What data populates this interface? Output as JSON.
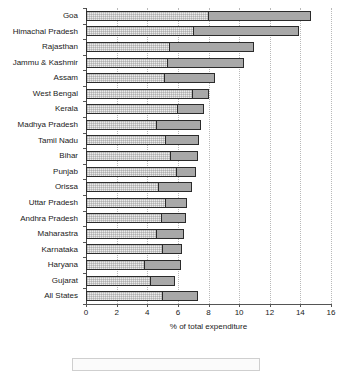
{
  "chart_data": {
    "type": "bar",
    "orientation": "horizontal",
    "stacked": true,
    "title": "",
    "xlabel": "% of total expenditure",
    "ylabel": "",
    "xlim": [
      0,
      16
    ],
    "xticks": [
      0,
      2,
      4,
      6,
      8,
      10,
      12,
      14,
      16
    ],
    "xtick_labels": [
      "0",
      "2",
      "4",
      "6",
      "8",
      "10",
      "12",
      "14",
      "16"
    ],
    "grid": "vertical-dotted",
    "legend": "none",
    "categories": [
      "Goa",
      "Himachal Pradesh",
      "Rajasthan",
      "Jammu & Kashmir",
      "Assam",
      "West Bengal",
      "Kerala",
      "Madhya Pradesh",
      "Tamil Nadu",
      "Bihar",
      "Punjab",
      "Orissa",
      "Uttar Pradesh",
      "Andhra Pradesh",
      "Maharastra",
      "Karnataka",
      "Haryana",
      "Gujarat",
      "All States"
    ],
    "series": [
      {
        "name": "segment-a",
        "color": "#ebebeb",
        "values": [
          8.0,
          7.0,
          5.4,
          5.3,
          5.1,
          7.0,
          6.0,
          4.6,
          5.2,
          5.5,
          5.9,
          4.7,
          5.2,
          4.9,
          4.6,
          5.0,
          3.8,
          4.2,
          5.0
        ]
      },
      {
        "name": "segment-b",
        "color": "#a8a8a8",
        "values": [
          6.7,
          6.9,
          5.6,
          5.0,
          3.3,
          1.0,
          1.7,
          2.9,
          2.2,
          1.8,
          1.3,
          2.2,
          1.4,
          1.6,
          1.8,
          1.3,
          2.4,
          1.6,
          2.3
        ]
      }
    ],
    "totals": [
      14.7,
      13.9,
      11.0,
      10.3,
      8.4,
      8.0,
      7.7,
      7.5,
      7.4,
      7.3,
      7.2,
      6.9,
      6.6,
      6.5,
      6.4,
      6.3,
      6.2,
      5.8,
      7.3
    ]
  }
}
